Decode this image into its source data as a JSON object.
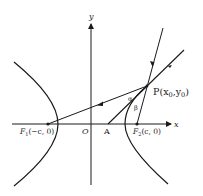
{
  "diagram": {
    "axes": {
      "x_label": "x",
      "y_label": "y",
      "origin_label": "O"
    },
    "points": {
      "F1": {
        "name": "F",
        "sub": "1",
        "coords": "(−c, 0)"
      },
      "F2": {
        "name": "F",
        "sub": "2",
        "coords": "(c, 0)"
      },
      "A": {
        "label": "A"
      },
      "P": {
        "label": "P",
        "coords_x": "x",
        "coords_x_sub": "0",
        "coords_y": "y",
        "coords_y_sub": "0"
      }
    },
    "angles": {
      "alpha": "α",
      "beta": "β"
    },
    "colors": {
      "ink": "#1a1a1a",
      "background": "#ffffff"
    }
  }
}
